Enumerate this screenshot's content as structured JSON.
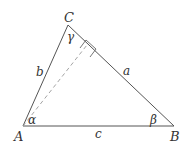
{
  "diagram": {
    "type": "triangle",
    "vertices": {
      "A": {
        "label": "A",
        "x": 23,
        "y": 126
      },
      "B": {
        "label": "B",
        "x": 174,
        "y": 126
      },
      "C": {
        "label": "C",
        "x": 68,
        "y": 25
      }
    },
    "sides": {
      "a": {
        "label": "a"
      },
      "b": {
        "label": "b"
      },
      "c": {
        "label": "c"
      }
    },
    "angles": {
      "alpha": {
        "label": "α"
      },
      "beta": {
        "label": "β"
      },
      "gamma": {
        "label": "γ"
      }
    },
    "altitude": {
      "from": "A",
      "to_side": "a",
      "style": "dashed",
      "right_angle_marker": true
    },
    "colors": {
      "line": "#555555",
      "dashed": "#9a9a9a",
      "text": "#333333"
    }
  }
}
